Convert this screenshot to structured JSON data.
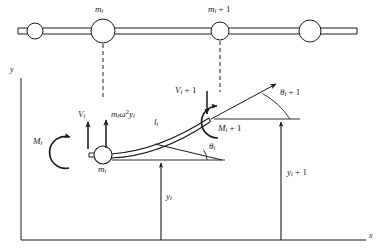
{
  "figure": {
    "background_color": "#ffffff",
    "line_color": "#1a1a1a",
    "width": 380,
    "height": 252
  },
  "shaft": {
    "name": "horizontal-shaft",
    "y_center": 31,
    "masses": [
      {
        "id": "mass-left-unlabeled",
        "cx": 35,
        "r": 8,
        "label": ""
      },
      {
        "id": "mass-i",
        "cx": 103,
        "r": 12,
        "label": "m_i"
      },
      {
        "id": "mass-i-plus-1",
        "cx": 220,
        "r": 9,
        "label": "m_i + 1"
      },
      {
        "id": "mass-right-unlabeled",
        "cx": 310,
        "r": 11,
        "label": ""
      }
    ],
    "labels": {
      "mass_i": {
        "base": "m",
        "sub": "i",
        "x": 95,
        "y": 8
      },
      "mass_i_plus_1": {
        "base": "m",
        "sub": "i",
        "suffix": " + 1",
        "x": 209,
        "y": 8
      }
    }
  },
  "axes": {
    "y_axis_label": "y",
    "x_axis_label": "x",
    "y_label_pos": {
      "x": 11,
      "y": 69
    },
    "x_label_pos": {
      "x": 369,
      "y": 234
    },
    "origin": {
      "x": 21,
      "y": 240
    },
    "y_top": 78,
    "x_right": 366
  },
  "beam": {
    "node_i": {
      "cx": 103,
      "cy": 155,
      "r": 9,
      "label": "m_i"
    },
    "node_i_plus_1": {
      "x": 208,
      "y": 119
    },
    "label_length": {
      "base": "l",
      "sub": "i",
      "x": 155,
      "y": 122
    },
    "label_node_i": {
      "base": "m",
      "sub": "i",
      "x": 99,
      "y": 168
    }
  },
  "forces": [
    {
      "id": "shear-force-i",
      "label": {
        "base": "V",
        "sub": "i"
      },
      "label_x": 80,
      "label_y": 114,
      "direction": "up",
      "arrow_x": 88,
      "arrow_y_tail": 148,
      "arrow_y_head": 120
    },
    {
      "id": "centrifugal-force-i",
      "label": {
        "base": "m",
        "sub": "i",
        "mid": "ω",
        "sup": "2",
        "base2": "y",
        "sub2": "i"
      },
      "label_x": 109,
      "label_y": 113,
      "direction": "up",
      "arrow_x": 105,
      "arrow_y_tail": 148,
      "arrow_y_head": 118
    },
    {
      "id": "shear-force-i-plus-1",
      "label": {
        "base": "V",
        "sub": "i",
        "suffix": " + 1"
      },
      "label_x": 176,
      "label_y": 90,
      "direction": "down",
      "arrow_x": 208,
      "arrow_y_tail": 92,
      "arrow_y_head": 117
    }
  ],
  "moments": [
    {
      "id": "moment-i",
      "label": {
        "base": "M",
        "sub": "i"
      },
      "label_x": 34,
      "label_y": 141,
      "arc_cx": 72,
      "arc_cy": 152,
      "arc_r": 16,
      "sense": "counterclockwise-open-right"
    },
    {
      "id": "moment-i-plus-1",
      "label": {
        "base": "M",
        "sub": "i",
        "suffix": " + 1"
      },
      "label_x": 218,
      "label_y": 128,
      "arc_cx": 219,
      "arc_cy": 122,
      "arc_r": 16,
      "sense": "clockwise-open-left"
    }
  ],
  "angles": [
    {
      "id": "angle-theta-i",
      "label": {
        "base": "θ",
        "sub": "i"
      },
      "label_x": 209,
      "label_y": 146,
      "vertex": {
        "x": 190,
        "y": 160
      },
      "description": "slope angle at node i between beam tangent and horizontal datum"
    },
    {
      "id": "angle-theta-i-plus-1",
      "label": {
        "base": "θ",
        "sub": "i",
        "suffix": " + 1"
      },
      "label_x": 280,
      "label_y": 92,
      "vertex": {
        "x": 279,
        "y": 119
      },
      "description": "slope angle at node i+1 between beam tangent and horizontal datum"
    }
  ],
  "dimensions": [
    {
      "id": "deflection-y-i",
      "label": {
        "base": "y",
        "sub": "i"
      },
      "label_x": 167,
      "label_y": 196,
      "line_x": 161,
      "y_top": 160,
      "y_bottom": 240
    },
    {
      "id": "deflection-y-i-plus-1",
      "label": {
        "base": "y",
        "sub": "i",
        "suffix": " + 1"
      },
      "label_x": 288,
      "label_y": 172,
      "line_x": 281,
      "y_top": 119,
      "y_bottom": 240
    }
  ],
  "dashed_leaders": [
    {
      "id": "leader-mass-i",
      "x": 103,
      "y_top": 43,
      "y_bottom": 100
    },
    {
      "id": "leader-mass-i-plus-1",
      "x": 220,
      "y_top": 40,
      "y_bottom": 92
    }
  ]
}
